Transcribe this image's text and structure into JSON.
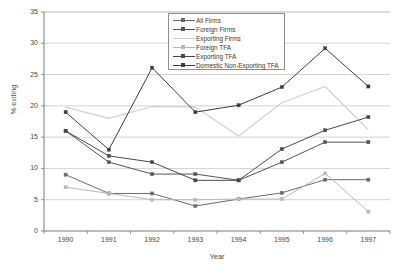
{
  "chart_data": {
    "type": "line",
    "title": "",
    "xlabel": "Year",
    "ylabel": "% exiting",
    "categories": [
      "1990",
      "1991",
      "1992",
      "1993",
      "1994",
      "1995",
      "1996",
      "1997"
    ],
    "x": [
      1990,
      1991,
      1992,
      1993,
      1994,
      1995,
      1996,
      1997
    ],
    "xlim": [
      1989.5,
      1997.5
    ],
    "ylim": [
      0,
      35
    ],
    "yticks": [
      0,
      5,
      10,
      15,
      20,
      25,
      30,
      35
    ],
    "grid": "horizontal",
    "legend_position": "top-center",
    "series": [
      {
        "name": "All Firms",
        "color": "#6b6b6b",
        "marker": "square",
        "values": [
          9.0,
          6.0,
          6.0,
          4.0,
          5.1,
          6.1,
          8.2,
          8.2
        ]
      },
      {
        "name": "Foreign Firms",
        "color": "#555555",
        "marker": "square",
        "values": [
          16.0,
          11.0,
          9.1,
          9.1,
          8.1,
          11.0,
          14.2,
          14.2
        ]
      },
      {
        "name": "Exporting Firms",
        "color": "#d0d0d0",
        "marker": "none",
        "values": [
          19.8,
          18.0,
          19.9,
          19.8,
          15.2,
          20.5,
          23.1,
          16.2
        ]
      },
      {
        "name": "Foreign TFA",
        "color": "#b8b8b8",
        "marker": "square",
        "values": [
          7.0,
          6.0,
          5.0,
          5.0,
          5.1,
          5.1,
          9.2,
          3.1
        ]
      },
      {
        "name": "Exporting TFA",
        "color": "#4a4a4a",
        "marker": "square",
        "values": [
          16.0,
          12.0,
          11.0,
          8.1,
          8.1,
          13.1,
          16.1,
          18.2
        ]
      },
      {
        "name": "Domestic Non-Exporting TFA",
        "color": "#3d3d3d",
        "marker": "square",
        "values": [
          19.0,
          13.0,
          26.1,
          19.0,
          20.1,
          23.0,
          29.2,
          23.1
        ]
      }
    ]
  },
  "axes": {
    "y_label": "% exiting",
    "x_label": "Year",
    "y_tick_labels": [
      "0",
      "5",
      "10",
      "15",
      "20",
      "25",
      "30",
      "35"
    ],
    "x_tick_labels": [
      "1990",
      "1991",
      "1992",
      "1993",
      "1994",
      "1995",
      "1996",
      "1997"
    ]
  },
  "legend": {
    "items": [
      {
        "label": "All Firms"
      },
      {
        "label": "Foreign Firms"
      },
      {
        "label": "Exporting Firms"
      },
      {
        "label": "Foreign TFA"
      },
      {
        "label": "Exporting TFA"
      },
      {
        "label": "Domestic Non-Exporting TFA"
      }
    ]
  },
  "style": {
    "plot_border_color": "#7a7a7a",
    "grid_color": "#bfbfbf",
    "background": "#ffffff"
  }
}
